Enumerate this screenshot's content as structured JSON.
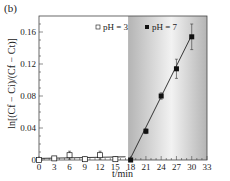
{
  "panel_label": "(b)",
  "axes": {
    "xlabel": "t/min",
    "ylabel": "ln[(Cf − Ci)/(Cf − Ct)]",
    "xticks": [
      "0",
      "3",
      "6",
      "9",
      "12",
      "15",
      "18",
      "21",
      "24",
      "27",
      "30",
      "33"
    ],
    "yticks": [
      "0",
      "0.04",
      "0.08",
      "0.12",
      "0.16"
    ]
  },
  "legend": {
    "ph3": "pH = 3",
    "ph7": "pH = 7"
  },
  "colors": {
    "marker": "#111111",
    "fit_line": "#222222",
    "shade_dark": "#b4b4b4",
    "shade_light": "#f2f2f2"
  },
  "chart_data": {
    "type": "scatter",
    "title": "",
    "panel": "(b)",
    "xlabel": "t/min",
    "ylabel": "ln[(Cf − Ci)/(Cf − Ct)]",
    "xlim": [
      0,
      33
    ],
    "ylim": [
      0,
      0.175
    ],
    "xticks": [
      0,
      3,
      6,
      9,
      12,
      15,
      18,
      21,
      24,
      27,
      30,
      33
    ],
    "yticks": [
      0,
      0.04,
      0.08,
      0.12,
      0.16
    ],
    "grid": false,
    "legend_position": "top, inside plot",
    "shaded_region": {
      "x_start": 17.5,
      "x_end": 33,
      "description": "gray gradient background for pH = 7 regime"
    },
    "series": [
      {
        "name": "pH = 3",
        "marker": "open square",
        "x": [
          0,
          3,
          6,
          9,
          12,
          15
        ],
        "values": [
          0.0,
          0.002,
          0.006,
          0.001,
          0.006,
          0.001
        ],
        "error": [
          0.001,
          0.002,
          0.005,
          0.002,
          0.005,
          0.002
        ],
        "fit": {
          "type": "linear",
          "x": [
            0,
            17
          ],
          "y": [
            0.002,
            0.004
          ]
        }
      },
      {
        "name": "pH = 7",
        "marker": "filled square",
        "x": [
          18,
          21,
          24,
          27,
          30
        ],
        "values": [
          0.0,
          0.036,
          0.08,
          0.114,
          0.154
        ],
        "error": [
          0.002,
          0.003,
          0.004,
          0.012,
          0.016
        ],
        "fit": {
          "type": "linear",
          "x": [
            17.8,
            30
          ],
          "y": [
            0.0,
            0.156
          ]
        }
      }
    ]
  }
}
